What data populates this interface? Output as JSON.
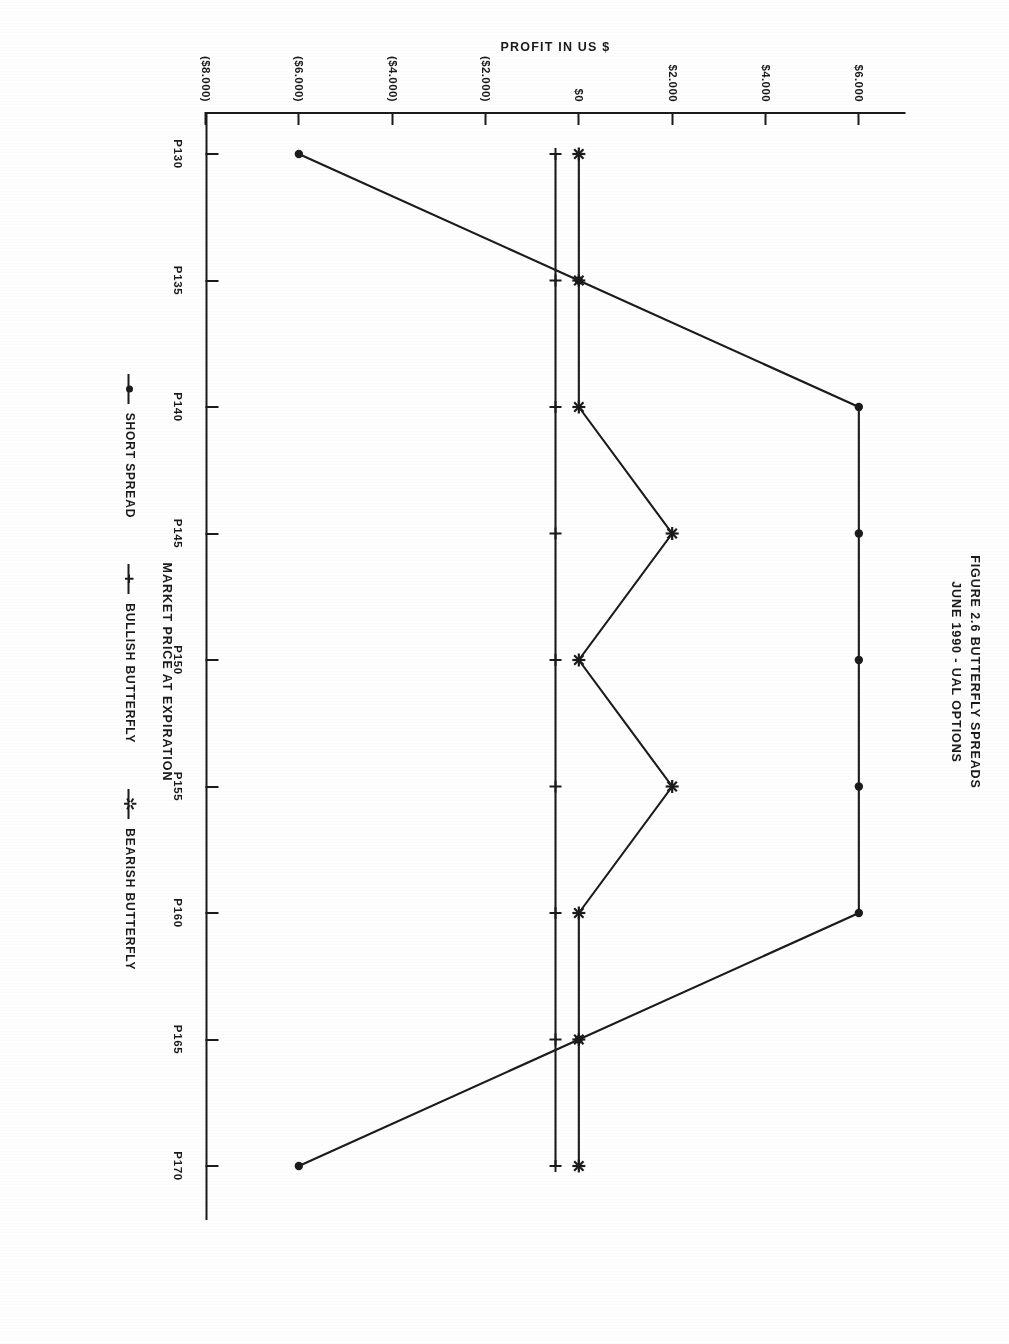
{
  "title": {
    "line1": "FIGURE 2.6 BUTTERFLY SPREADS",
    "line2": "JUNE 1990 - UAL OPTIONS"
  },
  "legend": [
    {
      "label": "SHORT SPREAD",
      "marker": "filled-dot-marker"
    },
    {
      "label": "BULLISH BUTTERFLY",
      "marker": "plus-cross-marker"
    },
    {
      "label": "BEARISH BUTTERFLY",
      "marker": "asterisk-star-marker"
    }
  ],
  "chart_data": {
    "type": "line",
    "title": "FIGURE 2.6 BUTTERFLY SPREADS\nJUNE 1990 - UAL OPTIONS",
    "xlabel": "MARKET PRICE AT EXPIRATION",
    "ylabel": "PROFIT IN US $",
    "categories": [
      "P130",
      "P135",
      "P140",
      "P145",
      "P150",
      "P155",
      "P160",
      "P165",
      "P170"
    ],
    "x_tick_labels": [
      "P130",
      "P135",
      "P140",
      "P145",
      "P150",
      "P155",
      "P160",
      "P165",
      "P170"
    ],
    "y_tick_labels": [
      "$6.000",
      "$4.000",
      "$2.000",
      "$0",
      "($2.000)",
      "($4.000)",
      "($6.000)",
      "($8.000)"
    ],
    "y_tick_values": [
      6000,
      4000,
      2000,
      0,
      -2000,
      -4000,
      -6000,
      -8000
    ],
    "ylim": [
      -8000,
      7000
    ],
    "grid": false,
    "legend_position": "below-axis",
    "series": [
      {
        "name": "SHORT SPREAD",
        "marker": "filled-dot-marker",
        "values": [
          -6000,
          0,
          6000,
          6000,
          6000,
          6000,
          6000,
          0,
          -6000
        ]
      },
      {
        "name": "BULLISH BUTTERFLY",
        "marker": "plus-cross-marker",
        "values": [
          -500,
          -500,
          -500,
          -500,
          -500,
          -500,
          -500,
          -500,
          -500
        ]
      },
      {
        "name": "BEARISH BUTTERFLY",
        "marker": "asterisk-star-marker",
        "values": [
          0,
          0,
          0,
          2000,
          0,
          2000,
          0,
          0,
          0
        ]
      }
    ]
  }
}
